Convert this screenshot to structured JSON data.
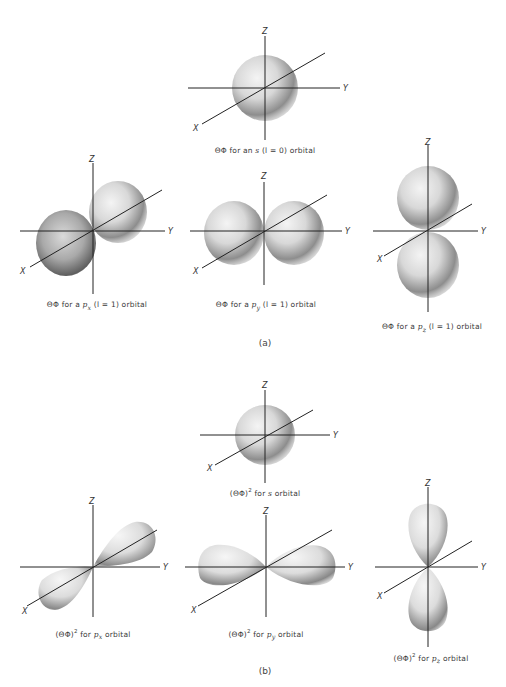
{
  "figure": {
    "parts": [
      {
        "label": "(a)",
        "panels": [
          {
            "id": "s",
            "caption_prefix": "ΘΦ for an ",
            "orbital": "s",
            "caption_suffix": " (l = 0) orbital"
          },
          {
            "id": "px",
            "caption_prefix": "ΘΦ for a ",
            "orbital": "p",
            "sub": "x",
            "caption_suffix": " (l = 1) orbital"
          },
          {
            "id": "py",
            "caption_prefix": "ΘΦ for a ",
            "orbital": "p",
            "sub": "y",
            "caption_suffix": " (l = 1) orbital"
          },
          {
            "id": "pz",
            "caption_prefix": "ΘΦ for a ",
            "orbital": "p",
            "sub": "z",
            "caption_suffix": " (l = 1) orbital"
          }
        ]
      },
      {
        "label": "(b)",
        "panels": [
          {
            "id": "s2",
            "caption_prefix": "(ΘΦ)",
            "sup": "2",
            "caption_mid": " for ",
            "orbital": "s",
            "caption_suffix": " orbital"
          },
          {
            "id": "px2",
            "caption_prefix": "(ΘΦ)",
            "sup": "2",
            "caption_mid": " for ",
            "orbital": "p",
            "sub": "x",
            "caption_suffix": " orbital"
          },
          {
            "id": "py2",
            "caption_prefix": "(ΘΦ)",
            "sup": "2",
            "caption_mid": " for ",
            "orbital": "p",
            "sub": "y",
            "caption_suffix": " orbital"
          },
          {
            "id": "pz2",
            "caption_prefix": "(ΘΦ)",
            "sup": "2",
            "caption_mid": " for ",
            "orbital": "p",
            "sub": "z",
            "caption_suffix": " orbital"
          }
        ]
      }
    ],
    "axis_labels": {
      "x": "X",
      "y": "Y",
      "z": "Z"
    }
  }
}
